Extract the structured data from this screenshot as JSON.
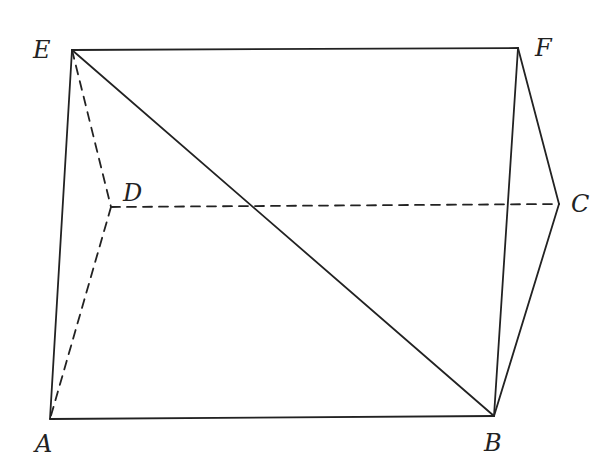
{
  "diagram": {
    "type": "geometry-solid",
    "stroke_color": "#222222",
    "background": "#ffffff",
    "points": {
      "E": {
        "label": "E",
        "x": 72,
        "y": 50,
        "lx": 33,
        "ly": 38
      },
      "F": {
        "label": "F",
        "x": 518,
        "y": 48,
        "lx": 535,
        "ly": 36
      },
      "D": {
        "label": "D",
        "x": 111,
        "y": 207,
        "lx": 123,
        "ly": 181
      },
      "C": {
        "label": "C",
        "x": 559,
        "y": 204,
        "lx": 571,
        "ly": 192
      },
      "A": {
        "label": "A",
        "x": 50,
        "y": 419,
        "lx": 35,
        "ly": 432
      },
      "B": {
        "label": "B",
        "x": 494,
        "y": 416,
        "lx": 484,
        "ly": 431
      }
    },
    "solid_edges": [
      [
        "E",
        "F"
      ],
      [
        "E",
        "A"
      ],
      [
        "A",
        "B"
      ],
      [
        "E",
        "B"
      ],
      [
        "F",
        "B"
      ],
      [
        "F",
        "C"
      ],
      [
        "C",
        "B"
      ]
    ],
    "dashed_edges": [
      [
        "E",
        "D"
      ],
      [
        "D",
        "A"
      ],
      [
        "D",
        "C"
      ]
    ]
  }
}
